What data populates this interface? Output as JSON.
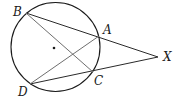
{
  "figure": {
    "points": [
      {
        "id": "A",
        "label": "A"
      },
      {
        "id": "B",
        "label": "B"
      },
      {
        "id": "C",
        "label": "C"
      },
      {
        "id": "D",
        "label": "D"
      },
      {
        "id": "X",
        "label": "X"
      }
    ],
    "segments": [
      {
        "from": "B",
        "to": "X",
        "style": "dark"
      },
      {
        "from": "D",
        "to": "X",
        "style": "dark"
      },
      {
        "from": "B",
        "to": "C",
        "style": "gray"
      },
      {
        "from": "D",
        "to": "A",
        "style": "gray"
      }
    ],
    "center_marked": true
  }
}
